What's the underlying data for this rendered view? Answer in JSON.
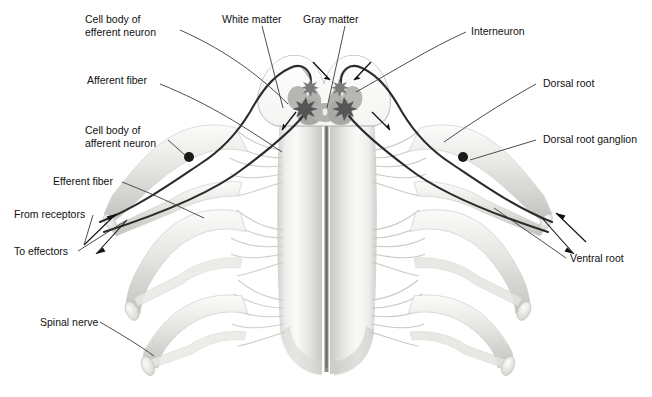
{
  "figure": {
    "background_color": "#ffffff",
    "text_color": "#111111",
    "leader_color": "#3a3a3a",
    "cord_light": "#f2f2f0",
    "cord_mid": "#d9d9d6",
    "cord_dark": "#b9b9b5",
    "gray_matter_color": "#b0b0ac",
    "fiber_color": "#2b2b2b",
    "ganglion_color": "#1a1a1a",
    "synapse_color": "#555555"
  },
  "labels": {
    "cell_body_efferent_line1": "Cell body of",
    "cell_body_efferent_line2": "efferent neuron",
    "white_matter": "White matter",
    "gray_matter": "Gray matter",
    "interneuron": "Interneuron",
    "afferent_fiber": "Afferent fiber",
    "dorsal_root": "Dorsal root",
    "cell_body_afferent_line1": "Cell body of",
    "cell_body_afferent_line2": "afferent neuron",
    "dorsal_root_ganglion": "Dorsal root ganglion",
    "efferent_fiber": "Efferent fiber",
    "from_receptors": "From receptors",
    "to_effectors": "To effectors",
    "ventral_root": "Ventral root",
    "spinal_nerve": "Spinal nerve"
  },
  "structures": {
    "spinal_cord": "spinal-cord-body",
    "median_fissure": "anterior-median-fissure",
    "gray_matter_butterfly": "gray-matter-butterfly",
    "left_ganglion_dot": "left-dorsal-root-ganglion-cell-body",
    "right_ganglion_dot": "right-dorsal-root-ganglion-cell-body",
    "left_synapse": "left-synapse-star",
    "right_synapse": "right-synapse-star",
    "rootlets": "nerve-rootlets",
    "spinal_nerve_trunks": "spinal-nerve-trunks"
  }
}
